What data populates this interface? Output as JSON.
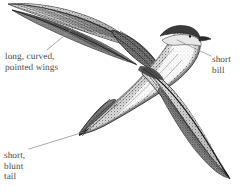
{
  "figure": {
    "background_color": "#ffffff",
    "ink_color": "#3a3a3a",
    "label_color": "#4a4a4a",
    "leader_color": "#8a8a8a"
  },
  "labels": [
    {
      "id": "wings",
      "lines": [
        "long, curved,",
        "pointed wings"
      ],
      "text": "long, curved,\npointed wings",
      "anchor": "upper-wing",
      "position": "left"
    },
    {
      "id": "bill",
      "lines": [
        "short",
        "bill"
      ],
      "text": "short\nbill",
      "anchor": "head-bill",
      "position": "right"
    },
    {
      "id": "tail",
      "lines": [
        "short,",
        "blunt",
        "tail"
      ],
      "text": "short,\nblunt\ntail",
      "anchor": "tail-tip",
      "position": "lower-left"
    }
  ],
  "leader_lines": [
    {
      "id": "leader-wings",
      "from": [
        47,
        50
      ],
      "to": [
        77,
        25
      ]
    },
    {
      "id": "leader-bill",
      "from": [
        211,
        56
      ],
      "to": [
        177,
        40
      ]
    },
    {
      "id": "leader-tail",
      "from": [
        29,
        149
      ],
      "to": [
        84,
        132
      ]
    }
  ],
  "anatomy": [
    {
      "id": "upper-wing",
      "name": "upper wing (far wing), swept and pointed"
    },
    {
      "id": "lower-wing",
      "name": "lower wing (near wing), swept and pointed"
    },
    {
      "id": "body",
      "name": "body, mottled grey-brown"
    },
    {
      "id": "head-bill",
      "name": "head with dark cap, pale throat and short bill"
    },
    {
      "id": "tail",
      "name": "short blunt tail"
    }
  ]
}
